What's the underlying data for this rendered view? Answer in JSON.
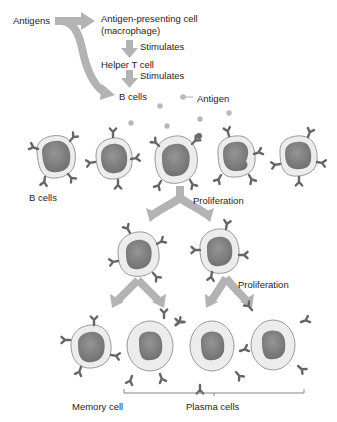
{
  "diagram": {
    "top_flow": {
      "antigens": "Antigens",
      "apc_line1": "Antigen-presenting cell",
      "apc_line2": "(macrophage)",
      "stimulates_1": "Stimulates",
      "helper_t": "Helper T cell",
      "stimulates_2": "Stimulates",
      "b_cells": "B cells",
      "antigen_legend": "Antigen"
    },
    "row1": {
      "label": "B cells",
      "proliferation": "Proliferation",
      "cells": [
        {
          "x": 55,
          "y": 158,
          "type": "b-cell"
        },
        {
          "x": 113,
          "y": 160,
          "type": "b-cell"
        },
        {
          "x": 175,
          "y": 161,
          "type": "b-cell-activated"
        },
        {
          "x": 236,
          "y": 158,
          "type": "b-cell"
        },
        {
          "x": 298,
          "y": 157,
          "type": "b-cell"
        }
      ]
    },
    "row2": {
      "proliferation": "Proliferation",
      "cells": [
        {
          "x": 138,
          "y": 255,
          "type": "b-cell"
        },
        {
          "x": 219,
          "y": 252,
          "type": "b-cell"
        }
      ]
    },
    "row3": {
      "memory_label": "Memory cell",
      "plasma_label": "Plasma cells",
      "cells": [
        {
          "x": 91,
          "y": 347,
          "type": "memory-cell"
        },
        {
          "x": 150,
          "y": 346,
          "type": "plasma-cell"
        },
        {
          "x": 212,
          "y": 346,
          "type": "plasma-cell"
        },
        {
          "x": 273,
          "y": 345,
          "type": "plasma-cell"
        }
      ]
    },
    "colors": {
      "arrow": "#b3b3b3",
      "cell_fill": "#ececec",
      "cell_outline": "#9a9a9a",
      "nucleus": "#7e7e7e",
      "receptor": "#6b6b6b",
      "antigen_dot": "#b8b8b8"
    }
  }
}
